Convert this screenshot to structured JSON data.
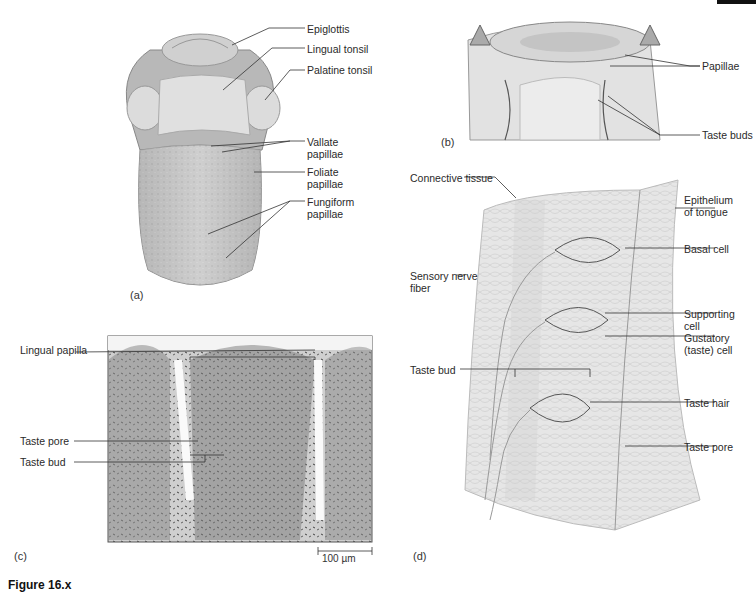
{
  "figure": {
    "caption_fragment": "Figure 16.x",
    "panels": {
      "a": {
        "letter": "(a)",
        "title": "Tongue (dorsal view)",
        "labels": [
          "Epiglottis",
          "Lingual tonsil",
          "Palatine tonsil",
          "Vallate\npapillae",
          "Foliate\npapillae",
          "Fungiform\npapillae"
        ]
      },
      "b": {
        "letter": "(b)",
        "title": "Vallate papilla section",
        "labels": [
          "Papillae",
          "Taste buds"
        ]
      },
      "c": {
        "letter": "(c)",
        "title": "Micrograph",
        "labels": [
          "Lingual papilla",
          "Taste pore",
          "Taste bud"
        ],
        "scale_bar": "100 µm"
      },
      "d": {
        "letter": "(d)",
        "title": "Taste bud structure",
        "labels": [
          "Connective tissue",
          "Epithelium\nof tongue",
          "Basal cell",
          "Sensory nerve\nfiber",
          "Supporting\ncell",
          "Gustatory\n(taste) cell",
          "Taste bud",
          "Taste hair",
          "Taste pore"
        ]
      }
    }
  },
  "labels": {
    "epiglottis": "Epiglottis",
    "lingual_tonsil": "Lingual tonsil",
    "palatine_tonsil": "Palatine tonsil",
    "vallate_1": "Vallate",
    "vallate_2": "papillae",
    "foliate_1": "Foliate",
    "foliate_2": "papillae",
    "fungiform_1": "Fungiform",
    "fungiform_2": "papillae",
    "papillae": "Papillae",
    "taste_buds": "Taste buds",
    "lingual_papilla": "Lingual papilla",
    "c_taste_pore": "Taste pore",
    "c_taste_bud": "Taste bud",
    "connective_tissue": "Connective tissue",
    "epithelium_1": "Epithelium",
    "epithelium_2": "of tongue",
    "basal_cell": "Basal cell",
    "sensory_1": "Sensory nerve",
    "sensory_2": "fiber",
    "supporting_1": "Supporting",
    "supporting_2": "cell",
    "gustatory_1": "Gustatory",
    "gustatory_2": "(taste) cell",
    "d_taste_bud": "Taste bud",
    "taste_hair": "Taste hair",
    "d_taste_pore": "Taste pore",
    "scale_bar": "100 µm",
    "letter_a": "(a)",
    "letter_b": "(b)",
    "letter_c": "(c)",
    "letter_d": "(d)"
  }
}
